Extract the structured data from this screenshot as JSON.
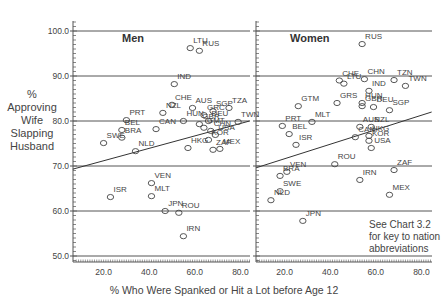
{
  "chart_data": [
    {
      "type": "scatter",
      "title": "Men",
      "xlabel": "% Who Were Spanked or Hit a Lot before Age 12",
      "ylabel": "% Approving Wife Slapping Husband",
      "xlim": [
        6.5,
        84
      ],
      "ylim": [
        47,
        102
      ],
      "xticks": [
        "20.0",
        "40.0",
        "60.0",
        "80.0"
      ],
      "yticks": [
        "50.0",
        "60.0",
        "70.0",
        "80.0",
        "90.0",
        "100.0"
      ],
      "grid": "horizontal",
      "regression_line": {
        "x": [
          6.5,
          84
        ],
        "y": [
          69.3,
          80.0
        ]
      },
      "points": [
        {
          "label": "LTU",
          "x": 58,
          "y": 96.2
        },
        {
          "label": "RUS",
          "x": 62,
          "y": 95.6
        },
        {
          "label": "IND",
          "x": 51,
          "y": 88.2
        },
        {
          "label": "AUS",
          "x": 59,
          "y": 82.9
        },
        {
          "label": "CHE",
          "x": 50,
          "y": 83.6
        },
        {
          "label": "NZL",
          "x": 46,
          "y": 81.8
        },
        {
          "label": "TZA",
          "x": 75,
          "y": 82.9
        },
        {
          "label": "SGP",
          "x": 68,
          "y": 82.2
        },
        {
          "label": "PRT",
          "x": 30,
          "y": 80.2
        },
        {
          "label": "BEL",
          "x": 28,
          "y": 78.0
        },
        {
          "label": "HUN",
          "x": 55,
          "y": 80.0
        },
        {
          "label": "GRC",
          "x": 64,
          "y": 81.3
        },
        {
          "label": "DEU",
          "x": 66,
          "y": 80.0
        },
        {
          "label": "TWN",
          "x": 79,
          "y": 79.8
        },
        {
          "label": "CAN",
          "x": 43,
          "y": 78.2
        },
        {
          "label": "GBR",
          "x": 62,
          "y": 79.3
        },
        {
          "label": "GMT",
          "x": 64,
          "y": 78.5
        },
        {
          "label": "CHN",
          "x": 67,
          "y": 77.8
        },
        {
          "label": "USA",
          "x": 69,
          "y": 76.9
        },
        {
          "label": "KOR",
          "x": 66,
          "y": 75.8
        },
        {
          "label": "BRA",
          "x": 28,
          "y": 76.3
        },
        {
          "label": "SWE",
          "x": 20,
          "y": 75.1
        },
        {
          "label": "NLD",
          "x": 34,
          "y": 73.3
        },
        {
          "label": "HKG",
          "x": 57,
          "y": 74.0
        },
        {
          "label": "ZAF",
          "x": 68,
          "y": 73.6
        },
        {
          "label": "MEX",
          "x": 71,
          "y": 73.8
        },
        {
          "label": "VEN",
          "x": 41,
          "y": 66.2
        },
        {
          "label": "MLT",
          "x": 41,
          "y": 63.3
        },
        {
          "label": "ISR",
          "x": 23,
          "y": 63.1
        },
        {
          "label": "JPN",
          "x": 47,
          "y": 60.0
        },
        {
          "label": "ROU",
          "x": 53,
          "y": 59.6
        },
        {
          "label": "IRN",
          "x": 55,
          "y": 54.4
        }
      ]
    },
    {
      "type": "scatter",
      "title": "Women",
      "xlabel": "% Who Were Spanked or Hit a Lot before Age 12",
      "ylabel": "% Approving Wife Slapping Husband",
      "xlim": [
        7.5,
        84.5
      ],
      "ylim": [
        47,
        102
      ],
      "xticks": [
        "20.0",
        "40.0",
        "60.0",
        "80.0"
      ],
      "yticks": [
        "50.0",
        "60.0",
        "70.0",
        "80.0",
        "90.0",
        "100.0"
      ],
      "grid": "horizontal",
      "regression_line": {
        "x": [
          7.5,
          84.5
        ],
        "y": [
          69.6,
          82.0
        ]
      },
      "points": [
        {
          "label": "RUS",
          "x": 54,
          "y": 97.1
        },
        {
          "label": "CHE",
          "x": 44,
          "y": 89.0
        },
        {
          "label": "LTU",
          "x": 46,
          "y": 88.3
        },
        {
          "label": "CHN",
          "x": 55,
          "y": 89.3
        },
        {
          "label": "TZN",
          "x": 68,
          "y": 89.1
        },
        {
          "label": "IND",
          "x": 57,
          "y": 86.7
        },
        {
          "label": "TWN",
          "x": 73,
          "y": 87.8
        },
        {
          "label": "GTM",
          "x": 26,
          "y": 83.3
        },
        {
          "label": "GRS",
          "x": 43,
          "y": 84.0
        },
        {
          "label": "HUN",
          "x": 54,
          "y": 84.0
        },
        {
          "label": "GBR",
          "x": 54,
          "y": 83.3
        },
        {
          "label": "DEU",
          "x": 59,
          "y": 83.1
        },
        {
          "label": "SGP",
          "x": 66,
          "y": 82.4
        },
        {
          "label": "MLT",
          "x": 32,
          "y": 79.8
        },
        {
          "label": "PRT",
          "x": 19,
          "y": 78.9
        },
        {
          "label": "BEL",
          "x": 22,
          "y": 77.1
        },
        {
          "label": "AUS",
          "x": 53,
          "y": 78.7
        },
        {
          "label": "NZL",
          "x": 58,
          "y": 78.7
        },
        {
          "label": "ISR",
          "x": 25,
          "y": 74.7
        },
        {
          "label": "CAN",
          "x": 51,
          "y": 76.4
        },
        {
          "label": "HKG",
          "x": 57,
          "y": 76.7
        },
        {
          "label": "KOR",
          "x": 57,
          "y": 75.6
        },
        {
          "label": "USA",
          "x": 58,
          "y": 74.0
        },
        {
          "label": "ROU",
          "x": 42,
          "y": 70.4
        },
        {
          "label": "ZAF",
          "x": 68,
          "y": 69.1
        },
        {
          "label": "IRN",
          "x": 53,
          "y": 66.9
        },
        {
          "label": "BRA",
          "x": 18,
          "y": 67.8
        },
        {
          "label": "VEN",
          "x": 21,
          "y": 68.7
        },
        {
          "label": "MEX",
          "x": 66,
          "y": 63.6
        },
        {
          "label": "SWE",
          "x": 18,
          "y": 64.4
        },
        {
          "label": "NLD",
          "x": 14,
          "y": 62.4
        },
        {
          "label": "JPN",
          "x": 28,
          "y": 57.8
        }
      ]
    }
  ],
  "labels": {
    "ylabel_lines": [
      "%",
      "Approving",
      "Wife",
      "Slapping",
      "Husband"
    ],
    "xlabel": "% Who Were Spanked or Hit a Lot before Age 12",
    "note_lines": [
      "See Chart 3.2",
      "for key to nation",
      "abbreviations"
    ]
  },
  "colors": {
    "axis": "#555555",
    "grid": "#555555",
    "text": "#444444",
    "marker": "#444444"
  }
}
